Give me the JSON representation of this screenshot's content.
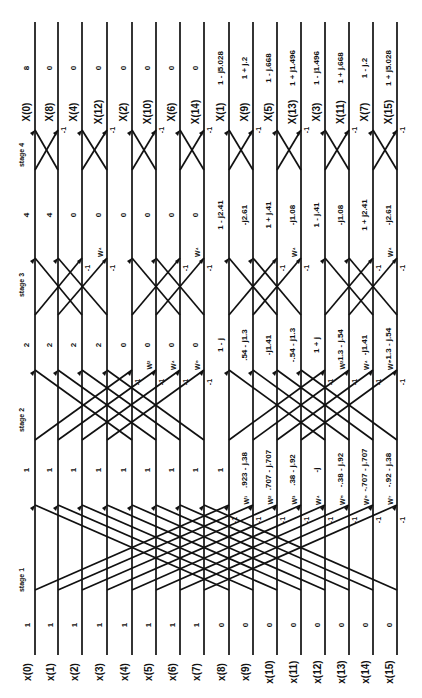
{
  "stages": [
    "stage 1",
    "stage 2",
    "stage 3",
    "stage 4"
  ],
  "inputs": {
    "labels": [
      "x(0)",
      "x(1)",
      "x(2)",
      "x(3)",
      "x(4)",
      "x(5)",
      "x(6)",
      "x(7)",
      "x(8)",
      "x(9)",
      "x(10)",
      "x(11)",
      "x(12)",
      "x(13)",
      "x(14)",
      "x(15)"
    ],
    "values": [
      "1",
      "1",
      "1",
      "1",
      "1",
      "1",
      "1",
      "1",
      "0",
      "0",
      "0",
      "0",
      "0",
      "0",
      "0",
      "0"
    ]
  },
  "stage1_outputs": [
    "1",
    "1",
    "1",
    "1",
    "1",
    "1",
    "1",
    "1",
    "1",
    ".923 - j.38",
    ".707 - j.707",
    ".38 - j.92",
    "-j",
    "-.38 - j.92",
    "-.707 - j.707",
    "-.92 - j.38"
  ],
  "stage1_twiddles": [
    "W¹",
    "W²",
    "W³",
    "W⁴",
    "W⁵",
    "W⁶",
    "W⁷"
  ],
  "stage2_outputs": [
    "2",
    "2",
    "2",
    "2",
    "0",
    "0",
    "0",
    "0",
    "1 - j",
    ".54 - j1.3",
    "-j1.41",
    "-.54 - j1.3",
    "1 + j",
    "1.3 - j.54",
    "-j1.41",
    "-1.3 - j.54"
  ],
  "stage2_twiddles": [
    "W²",
    "W⁴",
    "W⁶",
    "W²",
    "W⁴",
    "W⁶"
  ],
  "stage3_outputs": [
    "4",
    "4",
    "0",
    "0",
    "0",
    "0",
    "0",
    "0",
    "1 - j2.41",
    "-j2.61",
    "1 + j.41",
    "-j1.08",
    "1 - j.41",
    "-j1.08",
    "1 + j2.41",
    "-j2.61"
  ],
  "stage3_twiddles": [
    "W⁴",
    "W⁴",
    "W⁴",
    "W⁴"
  ],
  "outputs": {
    "labels": [
      "X(0)",
      "X(8)",
      "X(4)",
      "X(12)",
      "X(2)",
      "X(10)",
      "X(6)",
      "X(14)",
      "X(1)",
      "X(9)",
      "X(5)",
      "X(13)",
      "X(3)",
      "X(11)",
      "X(7)",
      "X(15)"
    ],
    "values": [
      "8",
      "0",
      "0",
      "0",
      "0",
      "0",
      "0",
      "0",
      "1 - j5.028",
      "1 + j.2",
      "1 - j.668",
      "1 + j1.496",
      "1 - j1.496",
      "1 + j.668",
      "1 - j.2",
      "1 + j5.028"
    ]
  },
  "minus_one": "-1"
}
